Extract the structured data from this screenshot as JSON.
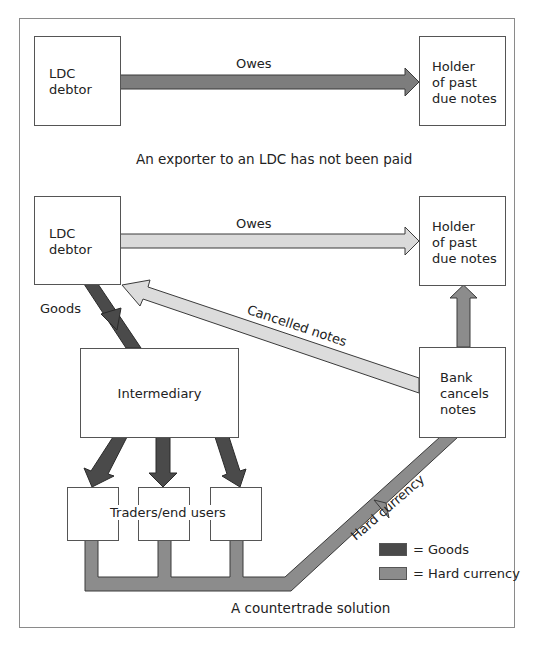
{
  "colors": {
    "goods": "#4a4a4a",
    "hard_currency": "#8c8c8c",
    "owes_dark": "#7d7d7d",
    "owes_light": "#d9d9d9",
    "cancelled_notes": "#dcdcdc",
    "outline": "#3a3a3a"
  },
  "panel1": {
    "debtor_label_line1": "LDC",
    "debtor_label_line2": "debtor",
    "holder_line1": "Holder",
    "holder_line2": "of past",
    "holder_line3": "due notes",
    "arrow_label": "Owes",
    "caption": "An exporter to an LDC has not been paid"
  },
  "panel2": {
    "debtor_label_line1": "LDC",
    "debtor_label_line2": "debtor",
    "holder_line1": "Holder",
    "holder_line2": "of past",
    "holder_line3": "due notes",
    "owes_label": "Owes",
    "goods_label": "Goods",
    "cancelled_label": "Cancelled notes",
    "intermediary_label": "Intermediary",
    "bank_line1": "Bank",
    "bank_line2": "cancels",
    "bank_line3": "notes",
    "traders_label": "Traders/end users",
    "hard_currency_label": "Hard currency",
    "caption": "A countertrade solution"
  },
  "legend": {
    "items": [
      {
        "label": "= Goods",
        "color": "#4a4a4a"
      },
      {
        "label": "= Hard currency",
        "color": "#8c8c8c"
      }
    ]
  }
}
